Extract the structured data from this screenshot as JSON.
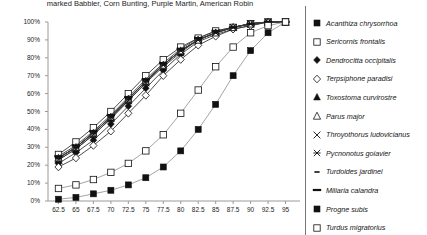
{
  "title": "marked Babbler, Corn Bunting, Purple Martin, American Robin",
  "legend": {
    "items": [
      {
        "label": "Acanthiza chrysorrhoa",
        "marker": "filled-square"
      },
      {
        "label": "Sericornis frontalis",
        "marker": "open-square"
      },
      {
        "label": "Dendrocitta occipitalis",
        "marker": "filled-diamond"
      },
      {
        "label": "Terpsiphone paradisi",
        "marker": "open-diamond"
      },
      {
        "label": "Toxostoma curvirostre",
        "marker": "filled-triangle"
      },
      {
        "label": "Parus major",
        "marker": "open-triangle"
      },
      {
        "label": "Throyothorus ludovicianus",
        "marker": "x-cross"
      },
      {
        "label": "Pycnonotus goiavier",
        "marker": "asterisk"
      },
      {
        "label": "Turdoides jardinei",
        "marker": "dash-short"
      },
      {
        "label": "Miliaria calandra",
        "marker": "dash-long"
      },
      {
        "label": "Progne subis",
        "marker": "filled-square-small"
      },
      {
        "label": "Turdus migratorius",
        "marker": "open-square-small"
      }
    ]
  },
  "chart_data": {
    "type": "line",
    "title": "marked Babbler, Corn Bunting, Purple Martin, American Robin",
    "xlabel": "",
    "ylabel": "",
    "grid": false,
    "legend_position": "right",
    "x": [
      62.5,
      65,
      67.5,
      70,
      72.5,
      75,
      77.5,
      80,
      82.5,
      85,
      87.5,
      90,
      92.5,
      95
    ],
    "xlim": [
      61.0,
      96.5
    ],
    "ylim": [
      0,
      100
    ],
    "ytick_labels": [
      "0%",
      "10%",
      "20%",
      "30%",
      "40%",
      "50%",
      "60%",
      "70%",
      "80%",
      "90%",
      "100%"
    ],
    "ytick_values": [
      0,
      10,
      20,
      30,
      40,
      50,
      60,
      70,
      80,
      90,
      100
    ],
    "xtick_labels": [
      "62.5",
      "65",
      "67.5",
      "70",
      "72.5",
      "75",
      "77.5",
      "80",
      "82.5",
      "85",
      "87.5",
      "90",
      "92.5",
      "95"
    ],
    "series": [
      {
        "name": "Acanthiza chrysorrhoa",
        "marker": "filled-square",
        "values": [
          24,
          30,
          38,
          47,
          57,
          67,
          76,
          84,
          90,
          94,
          97,
          99,
          100,
          100
        ]
      },
      {
        "name": "Sericornis frontalis",
        "marker": "open-square",
        "values": [
          26,
          33,
          41,
          50,
          60,
          70,
          79,
          86,
          91,
          95,
          97,
          99,
          100,
          100
        ]
      },
      {
        "name": "Dendrocitta occipitalis",
        "marker": "filled-diamond",
        "values": [
          21,
          27,
          34,
          43,
          53,
          63,
          73,
          82,
          89,
          93,
          96,
          98,
          100,
          100
        ]
      },
      {
        "name": "Terpsiphone paradisi",
        "marker": "open-diamond",
        "values": [
          19,
          24,
          31,
          39,
          49,
          59,
          70,
          79,
          87,
          92,
          96,
          98,
          100,
          100
        ]
      },
      {
        "name": "Toxostoma curvirostre",
        "marker": "filled-triangle",
        "values": [
          23,
          29,
          37,
          46,
          56,
          66,
          75,
          83,
          90,
          94,
          97,
          99,
          100,
          100
        ]
      },
      {
        "name": "Parus major",
        "marker": "open-triangle",
        "values": [
          24,
          30,
          38,
          47,
          57,
          67,
          76,
          84,
          90,
          94,
          97,
          99,
          100,
          100
        ]
      },
      {
        "name": "Throyothorus ludovicianus",
        "marker": "x-cross",
        "values": [
          23,
          29,
          37,
          46,
          56,
          66,
          76,
          84,
          90,
          94,
          97,
          99,
          100,
          100
        ]
      },
      {
        "name": "Pycnonotus goiavier",
        "marker": "asterisk",
        "values": [
          24,
          30,
          38,
          47,
          57,
          67,
          76,
          84,
          90,
          94,
          97,
          99,
          100,
          100
        ]
      },
      {
        "name": "Turdoides jardinei",
        "marker": "dash-short",
        "values": [
          24,
          30,
          38,
          47,
          57,
          67,
          76,
          84,
          90,
          94,
          97,
          99,
          100,
          100
        ]
      },
      {
        "name": "Miliaria calandra",
        "marker": "dash-long",
        "values": [
          25,
          31,
          39,
          48,
          58,
          68,
          77,
          85,
          91,
          95,
          97,
          99,
          100,
          100
        ]
      },
      {
        "name": "Progne subis",
        "marker": "filled-square-small",
        "values": [
          1,
          2,
          4,
          6,
          9,
          13,
          19,
          28,
          40,
          54,
          70,
          84,
          94,
          100
        ]
      },
      {
        "name": "Turdus migratorius",
        "marker": "open-square-small",
        "values": [
          7,
          9,
          12,
          16,
          21,
          28,
          37,
          49,
          62,
          75,
          86,
          94,
          98,
          100
        ]
      }
    ]
  }
}
